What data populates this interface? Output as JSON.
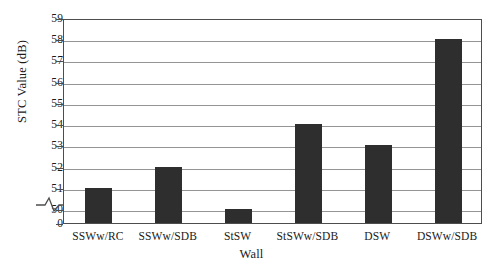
{
  "chart_data": {
    "type": "bar",
    "title": "",
    "xlabel": "Wall",
    "ylabel": "STC Value (dB)",
    "categories": [
      "SSWw/RC",
      "SSWw/SDB",
      "StSW",
      "StSWw/SDB",
      "DSW",
      "DSWw/SDB"
    ],
    "values": [
      51,
      52,
      50,
      54,
      53,
      58
    ],
    "ylim": [
      49.35,
      59
    ],
    "yticks": [
      0,
      50,
      51,
      52,
      53,
      54,
      55,
      56,
      57,
      58,
      59
    ],
    "ytick_labels": [
      "0",
      "50",
      "51",
      "52",
      "53",
      "54",
      "55",
      "56",
      "57",
      "58",
      "59"
    ],
    "grid": true,
    "grid_axis": "y",
    "legend": false,
    "axis_break": true,
    "axis_break_note": "y-axis broken between 0 and 50",
    "bar_color": "#2e2e2e",
    "grid_color": "#949494",
    "frame_color": "#4d4d4d",
    "background": "#ffffff"
  }
}
